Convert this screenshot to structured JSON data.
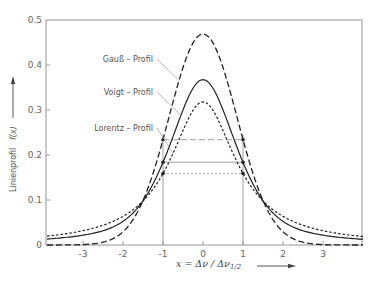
{
  "chart_data": {
    "type": "line",
    "title": "",
    "xlabel": "x = Δν / Δν1/2",
    "ylabel": "Linienprofil f(x)",
    "xlim": [
      -3.9,
      4.0
    ],
    "ylim": [
      0,
      0.5
    ],
    "x_ticks": [
      -3,
      -2,
      -1,
      0,
      1,
      2,
      3
    ],
    "y_ticks": [
      0,
      0.1,
      0.2,
      0.3,
      0.4,
      0.5
    ],
    "y_tick_labels": [
      "0",
      "0.1",
      "0.2",
      "0.3",
      "0.4",
      "0.5"
    ],
    "grid": false,
    "series": [
      {
        "name": "Gauß-Profil",
        "label": "Gauß – Profil",
        "style": "long-dash",
        "peak": 0.469,
        "half_max": 0.234,
        "hwhm": 1,
        "points": [
          [
            -3.9,
            0.0
          ],
          [
            -3,
            0.0
          ],
          [
            -2.5,
            0.006
          ],
          [
            -2,
            0.029
          ],
          [
            -1.5,
            0.088
          ],
          [
            -1,
            0.234
          ],
          [
            -0.5,
            0.394
          ],
          [
            0,
            0.469
          ],
          [
            0.5,
            0.394
          ],
          [
            1,
            0.234
          ],
          [
            1.5,
            0.088
          ],
          [
            2,
            0.029
          ],
          [
            2.5,
            0.006
          ],
          [
            3,
            0.0
          ],
          [
            4,
            0.0
          ]
        ]
      },
      {
        "name": "Voigt-Profil",
        "label": "Voigt – Profil",
        "style": "solid",
        "peak": 0.367,
        "half_max": 0.184,
        "hwhm": 1,
        "points": [
          [
            -3.9,
            0.013
          ],
          [
            -3,
            0.02
          ],
          [
            -2.5,
            0.03
          ],
          [
            -2,
            0.048
          ],
          [
            -1.5,
            0.09
          ],
          [
            -1,
            0.184
          ],
          [
            -0.5,
            0.31
          ],
          [
            0,
            0.367
          ],
          [
            0.5,
            0.31
          ],
          [
            1,
            0.184
          ],
          [
            1.5,
            0.09
          ],
          [
            2,
            0.048
          ],
          [
            2.5,
            0.03
          ],
          [
            3,
            0.02
          ],
          [
            4,
            0.012
          ]
        ]
      },
      {
        "name": "Lorentz-Profil",
        "label": "Lorentz – Profil",
        "style": "short-dash",
        "peak": 0.318,
        "half_max": 0.159,
        "hwhm": 1,
        "points": [
          [
            -3.9,
            0.019
          ],
          [
            -3,
            0.032
          ],
          [
            -2.5,
            0.044
          ],
          [
            -2,
            0.064
          ],
          [
            -1.5,
            0.098
          ],
          [
            -1,
            0.159
          ],
          [
            -0.5,
            0.255
          ],
          [
            0,
            0.318
          ],
          [
            0.5,
            0.255
          ],
          [
            1,
            0.159
          ],
          [
            1.5,
            0.098
          ],
          [
            2,
            0.064
          ],
          [
            2.5,
            0.044
          ],
          [
            3,
            0.032
          ],
          [
            4,
            0.018
          ]
        ]
      }
    ],
    "annotations": [
      {
        "text": "Gauß – Profil",
        "points_to": "Gauß-Profil"
      },
      {
        "text": "Voigt – Profil",
        "points_to": "Voigt-Profil"
      },
      {
        "text": "Lorentz – Profil",
        "points_to": "Lorentz-Profil"
      }
    ],
    "reference_lines": [
      {
        "type": "vertical",
        "x": -1
      },
      {
        "type": "vertical",
        "x": 1
      },
      {
        "type": "horizontal-segment",
        "y": 0.234,
        "from": -1,
        "to": 1,
        "style": "long-dash"
      },
      {
        "type": "horizontal-segment",
        "y": 0.184,
        "from": -1,
        "to": 1,
        "style": "solid"
      },
      {
        "type": "horizontal-segment",
        "y": 0.159,
        "from": -1,
        "to": 1,
        "style": "short-dash"
      }
    ]
  },
  "labels": {
    "gauss": "Gauß – Profil",
    "voigt": "Voigt – Profil",
    "lorentz": "Lorentz – Profil",
    "ylabel_text": "Linienprofil",
    "ylabel_fx": "f(x)",
    "xlabel_main": "x = Δν / Δν",
    "xlabel_sub": "1/2"
  }
}
